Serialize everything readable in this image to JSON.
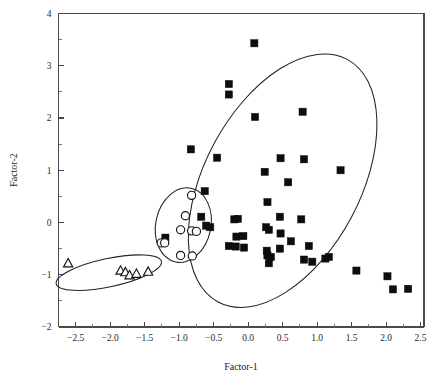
{
  "chart_data": {
    "type": "scatter",
    "title": "",
    "xlabel": "Factor-1",
    "ylabel": "Factor-2",
    "xlim": [
      -2.75,
      2.55
    ],
    "ylim": [
      -2,
      4
    ],
    "grid": false,
    "legend_position": "none",
    "xticks": [
      "-2.5",
      "-2.0",
      "-1.5",
      "-1.0",
      "-0.5",
      "0.0",
      "0.5",
      "1.0",
      "1.5",
      "2.0",
      "2.5"
    ],
    "xtick_values": [
      -2.5,
      -2.0,
      -1.5,
      -1.0,
      -0.5,
      0.0,
      0.5,
      1.0,
      1.5,
      2.0,
      2.5
    ],
    "xminor_values": [
      -2.25,
      -1.75,
      -1.25,
      -0.75,
      -0.25,
      0.25,
      0.75,
      1.25,
      1.75,
      2.25
    ],
    "yticks": [
      "4",
      "3",
      "2",
      "1",
      "0",
      "-1",
      "-2"
    ],
    "ytick_values": [
      4,
      3,
      2,
      1,
      0,
      -1,
      -2
    ],
    "yminor_values": [
      3.5,
      2.5,
      1.5,
      0.5,
      -0.5,
      -1.5
    ],
    "series": [
      {
        "name": "filled-squares",
        "marker": "square",
        "fill": "#0d0d0d",
        "points": [
          [
            0.09,
            3.43
          ],
          [
            -0.28,
            2.65
          ],
          [
            -0.28,
            2.45
          ],
          [
            0.1,
            2.02
          ],
          [
            0.79,
            2.12
          ],
          [
            -0.83,
            1.4
          ],
          [
            -0.45,
            1.24
          ],
          [
            0.47,
            1.23
          ],
          [
            0.81,
            1.21
          ],
          [
            0.24,
            0.97
          ],
          [
            1.34,
            1.0
          ],
          [
            0.58,
            0.77
          ],
          [
            -0.63,
            0.6
          ],
          [
            0.28,
            0.39
          ],
          [
            -0.68,
            0.11
          ],
          [
            -0.2,
            0.06
          ],
          [
            -0.15,
            0.07
          ],
          [
            0.46,
            0.11
          ],
          [
            0.77,
            0.06
          ],
          [
            -0.61,
            -0.06
          ],
          [
            -0.55,
            -0.09
          ],
          [
            0.26,
            -0.09
          ],
          [
            0.3,
            -0.14
          ],
          [
            -1.2,
            -0.29
          ],
          [
            -0.17,
            -0.27
          ],
          [
            0.47,
            -0.21
          ],
          [
            -0.07,
            -0.26
          ],
          [
            0.62,
            -0.36
          ],
          [
            -0.28,
            -0.45
          ],
          [
            -0.18,
            -0.46
          ],
          [
            0.46,
            -0.5
          ],
          [
            -0.06,
            -0.48
          ],
          [
            0.27,
            -0.54
          ],
          [
            0.88,
            -0.45
          ],
          [
            0.28,
            -0.63
          ],
          [
            0.33,
            -0.66
          ],
          [
            1.17,
            -0.66
          ],
          [
            1.12,
            -0.69
          ],
          [
            0.81,
            -0.71
          ],
          [
            0.3,
            -0.78
          ],
          [
            0.93,
            -0.75
          ],
          [
            1.57,
            -0.92
          ],
          [
            2.02,
            -1.03
          ],
          [
            2.1,
            -1.28
          ],
          [
            2.32,
            -1.27
          ]
        ]
      },
      {
        "name": "open-circles",
        "marker": "circle",
        "fill": "#ffffff",
        "points": [
          [
            -0.82,
            0.52
          ],
          [
            -0.91,
            0.13
          ],
          [
            -0.98,
            -0.14
          ],
          [
            -0.82,
            -0.16
          ],
          [
            -0.75,
            -0.17
          ],
          [
            -1.26,
            -0.39
          ],
          [
            -1.21,
            -0.39
          ],
          [
            -0.98,
            -0.63
          ],
          [
            -0.81,
            -0.64
          ]
        ]
      },
      {
        "name": "open-triangles",
        "marker": "triangle",
        "fill": "#ffffff",
        "points": [
          [
            -2.61,
            -0.78
          ],
          [
            -1.85,
            -0.92
          ],
          [
            -1.78,
            -0.95
          ],
          [
            -1.72,
            -1.01
          ],
          [
            -1.62,
            -0.98
          ],
          [
            -1.45,
            -0.94
          ]
        ]
      }
    ],
    "hulls": [
      {
        "name": "squares-ellipse",
        "cx": 0.5,
        "cy": 0.8,
        "rx": 1.13,
        "ry": 2.63,
        "rotation_deg": 28
      },
      {
        "name": "circles-ellipse",
        "cx": -0.94,
        "cy": -0.05,
        "rx": 0.4,
        "ry": 0.72,
        "rotation_deg": 12
      },
      {
        "name": "triangles-ellipse",
        "cx": -2.02,
        "cy": -0.96,
        "rx": 0.78,
        "ry": 0.27,
        "rotation_deg": -12
      }
    ]
  }
}
